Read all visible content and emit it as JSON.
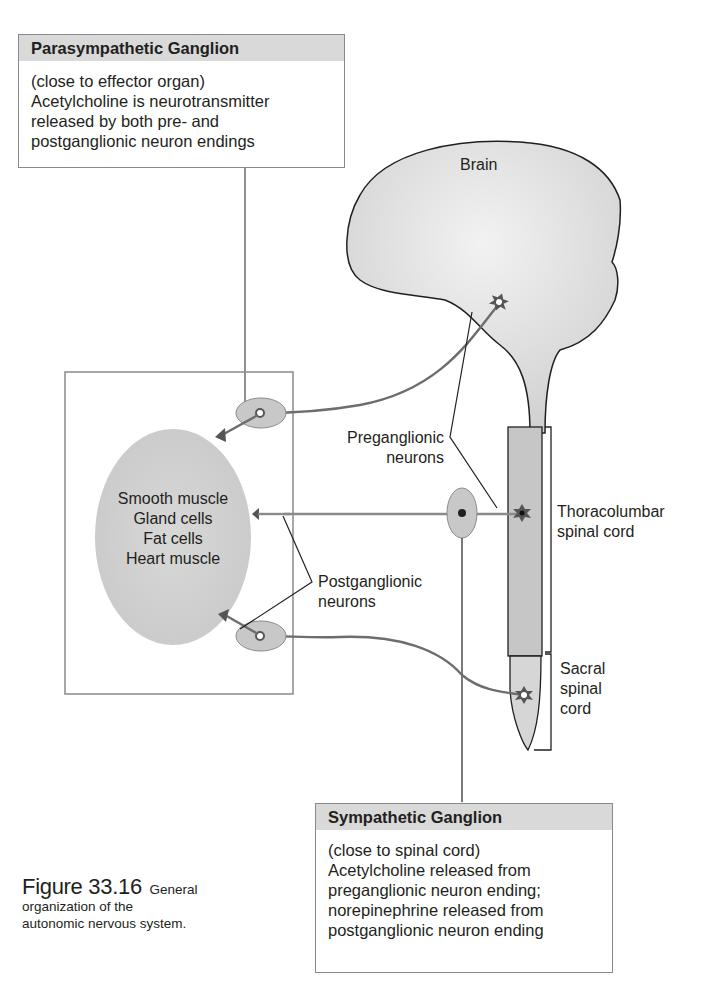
{
  "parasympathetic_box": {
    "title": "Parasympathetic Ganglion",
    "lines": [
      "(close to effector organ)",
      "Acetylcholine is neurotransmitter",
      "released by both pre- and",
      "postganglionic neuron endings"
    ]
  },
  "sympathetic_box": {
    "title": "Sympathetic Ganglion",
    "lines": [
      "(close to spinal cord)",
      "Acetylcholine released from",
      "preganglionic neuron ending;",
      "norepinephrine released from",
      "postganglionic neuron ending"
    ]
  },
  "labels": {
    "brain": "Brain",
    "effector_lines": [
      "Smooth muscle",
      "Gland cells",
      "Fat cells",
      "Heart muscle"
    ],
    "preganglionic": [
      "Preganglionic",
      "neurons"
    ],
    "postganglionic": [
      "Postganglionic",
      "neurons"
    ],
    "thoracolumbar": [
      "Thoracolumbar",
      "spinal cord"
    ],
    "sacral": [
      "Sacral",
      "spinal",
      "cord"
    ]
  },
  "caption": {
    "figure_number": "Figure 33.16",
    "text_line1": "General",
    "text_line2": "organization of the",
    "text_line3": "autonomic nervous system."
  },
  "colors": {
    "header_fill": "#d9d9d9",
    "tissue_fill": "#d4d4d4",
    "cord_fill": "#c8c8c8",
    "neuron_line": "#6d6d6d",
    "outline": "#231f20"
  }
}
